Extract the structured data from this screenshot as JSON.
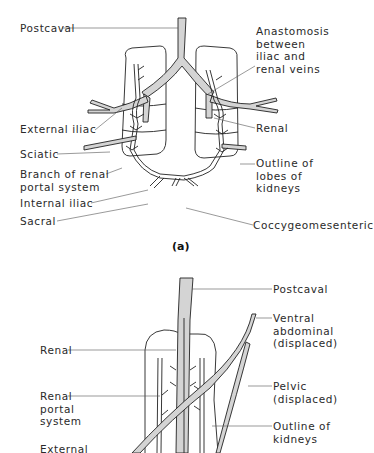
{
  "figure_a": {
    "panel_label": "(a)",
    "labels": {
      "postcaval": "Postcaval",
      "anastomosis": "Anastomosis\nbetween\niliac and\nrenal veins",
      "external_iliac": "External iliac",
      "renal": "Renal",
      "sciatic": "Sciatic",
      "branch_renal_portal": "Branch of renal\nportal system",
      "outline_lobes": "Outline of\nlobes of\nkidneys",
      "internal_iliac": "Internal iliac",
      "sacral": "Sacral",
      "coccygeomesenteric": "Coccygeomesenteric"
    }
  },
  "figure_b": {
    "labels": {
      "postcaval": "Postcaval",
      "ventral_abdominal": "Ventral\nabdominal\n(displaced)",
      "renal": "Renal",
      "pelvic": "Pelvic\n(displaced)",
      "renal_portal_system": "Renal\nportal\nsystem",
      "outline_kidneys": "Outline of\nkidneys",
      "external": "External"
    }
  },
  "colors": {
    "vessel_fill": "#d4d4d4",
    "line": "#222222",
    "text": "#2a2a2a"
  }
}
